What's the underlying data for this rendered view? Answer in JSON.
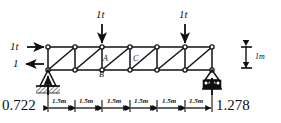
{
  "figure": {
    "type": "statics-truss-diagram",
    "title_fragment": "",
    "stroke_color": "#111111",
    "background_color": "#ffffff"
  },
  "loads": {
    "vertical": [
      {
        "label": "1t",
        "x_m": 4.5,
        "direction": "down",
        "applied_at": "top-chord"
      },
      {
        "label": "1t",
        "x_m": 7.5,
        "direction": "down",
        "applied_at": "top-chord"
      }
    ],
    "horizontal": [
      {
        "label": "1t",
        "direction": "right",
        "applied_at": "top-left-node"
      },
      {
        "label": "1",
        "direction": "left",
        "applied_at": "bottom-left-support"
      }
    ]
  },
  "supports": {
    "left": {
      "kind": "pin",
      "reaction_label": "0.722"
    },
    "right": {
      "kind": "roller",
      "reaction_label": "1.278"
    }
  },
  "node_labels": [
    {
      "id": "A",
      "text": "A"
    },
    {
      "id": "B",
      "text": "B"
    },
    {
      "id": "C",
      "text": "C"
    }
  ],
  "dimensions": {
    "panel_labels": [
      "1.5m",
      "1.5m",
      "1.5m",
      "1.5m",
      "1.5m",
      "1.5m"
    ],
    "height_label": "1m",
    "panel_count": 6,
    "panel_length_m": 1.5,
    "span_m": 9,
    "height_m": 1
  },
  "geometry": {
    "top_chord_nodes_x_m": [
      0,
      1.5,
      3.0,
      4.5,
      6.0,
      7.5,
      9.0
    ],
    "bottom_chord_nodes_x_m": [
      0,
      1.5,
      3.0,
      4.5,
      6.0,
      7.5,
      9.0
    ],
    "diagonals": "N-type, descending left-to-right in each panel"
  }
}
